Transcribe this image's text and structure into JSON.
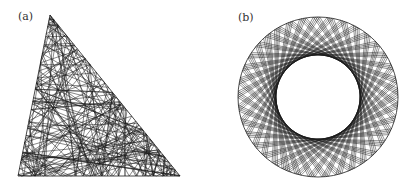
{
  "figure": {
    "panels": [
      {
        "label": "(a)",
        "description": "Billiard trajectory inside a right triangle",
        "shape": "triangle",
        "vertices": [
          [
            50,
            15
          ],
          [
            18,
            176
          ],
          [
            180,
            176
          ]
        ],
        "segments": 220,
        "seed": 7
      },
      {
        "label": "(b)",
        "description": "Billiard trajectory inside a circle forming an annular caustic",
        "shape": "circle",
        "center": [
          318,
          97
        ],
        "outer_radius": 80,
        "caustic_radius": 42,
        "chords": 150
      }
    ],
    "colors": {
      "line": "#1a1a1a",
      "background": "#ffffff"
    }
  }
}
